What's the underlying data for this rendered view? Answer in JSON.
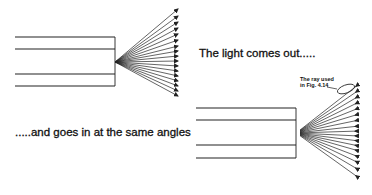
{
  "diagram": {
    "caption_out": "The light comes out.....",
    "caption_in": ".....and goes in at the same angles",
    "annotation": {
      "line1": "The ray used",
      "line2": "in Fig. 4.14"
    },
    "colors": {
      "ink": "#222222",
      "background": "#ffffff"
    },
    "fiber_out": {
      "lines_y": [
        37,
        49,
        74,
        86
      ],
      "x_start": 15,
      "x_end": 115,
      "fan_origin": [
        115,
        62
      ],
      "fan_end_x": 178,
      "fan_end_y": [
        9,
        16,
        22,
        28,
        34,
        40,
        46,
        51,
        56,
        61,
        66,
        71,
        76,
        81,
        86,
        91,
        96
      ],
      "arrow_direction": "outward"
    },
    "fiber_in": {
      "lines_y": [
        108,
        120,
        145,
        158
      ],
      "x_start": 196,
      "x_end": 296,
      "fan_origin": [
        296,
        133
      ],
      "fan_end_x": 359,
      "fan_end_y": [
        84,
        90,
        96,
        102,
        108,
        114,
        120,
        126,
        131,
        136,
        141,
        146,
        151,
        157,
        163,
        170,
        178
      ],
      "arrow_direction": "inward",
      "highlighted_ray_index": 1
    }
  }
}
